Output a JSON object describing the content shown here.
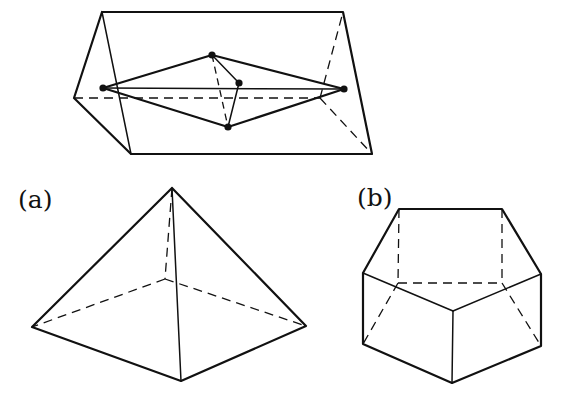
{
  "figure": {
    "labels": {
      "a": "(a)",
      "b": "(b)"
    },
    "colors": {
      "stroke": "#111111",
      "background": "#ffffff"
    }
  },
  "top_prism": {
    "description": "triangular prism containing a bipyramid with 5 marked vertices",
    "vertices": {
      "top_left": [
        102,
        12
      ],
      "top_right": [
        343,
        12
      ],
      "left": [
        74,
        98
      ],
      "hidden_right": [
        320,
        98
      ],
      "bottom_left": [
        131,
        154
      ],
      "bottom_right": [
        372,
        154
      ]
    },
    "inner_points": {
      "left_apex": [
        103,
        88
      ],
      "right_apex": [
        344,
        89
      ],
      "top": [
        212,
        55
      ],
      "middle": [
        239,
        83
      ],
      "bottom": [
        228,
        127
      ]
    }
  },
  "pyramid_a": {
    "description": "square pyramid",
    "vertices": {
      "apex": [
        172,
        188
      ],
      "left": [
        32,
        327
      ],
      "right": [
        306,
        326
      ],
      "front": [
        181,
        381
      ],
      "hidden_back": [
        165,
        279
      ]
    }
  },
  "prism_b": {
    "description": "pentagonal prism",
    "vertices": {
      "top_back_left": [
        399,
        209
      ],
      "top_back_right": [
        502,
        209
      ],
      "top_left": [
        363,
        273
      ],
      "top_right": [
        541,
        274
      ],
      "top_front": [
        453,
        311
      ],
      "bottom_left": [
        363,
        344
      ],
      "bottom_right": [
        541,
        346
      ],
      "bottom_front": [
        452,
        383
      ],
      "hidden_bottom_back_left": [
        398,
        283
      ],
      "hidden_bottom_back_right": [
        502,
        283
      ]
    }
  }
}
